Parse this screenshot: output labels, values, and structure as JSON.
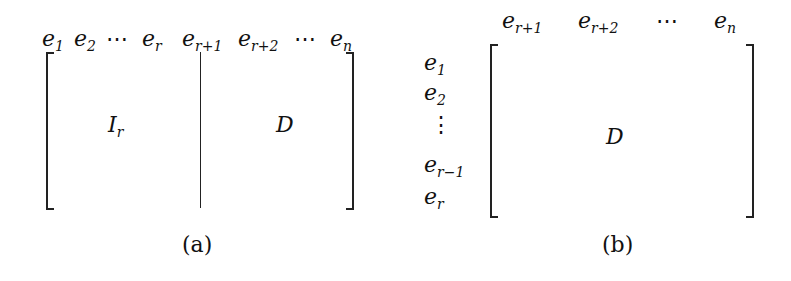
{
  "a": {
    "caption": "(a)",
    "center_left": "I",
    "center_left_sub": "r",
    "center_right": "D",
    "cols": [
      {
        "b": "e",
        "s": "1"
      },
      {
        "b": "e",
        "s": "2"
      },
      {
        "b": "⋯",
        "s": ""
      },
      {
        "b": "e",
        "s": "r"
      },
      {
        "b": "e",
        "s": "r+1"
      },
      {
        "b": "e",
        "s": "r+2"
      },
      {
        "b": "⋯",
        "s": ""
      },
      {
        "b": "e",
        "s": "n"
      }
    ]
  },
  "b": {
    "caption": "(b)",
    "center": "D",
    "cols": [
      {
        "b": "e",
        "s": "r+1"
      },
      {
        "b": "e",
        "s": "r+2"
      },
      {
        "b": "⋯",
        "s": ""
      },
      {
        "b": "e",
        "s": "n"
      }
    ],
    "rows": [
      {
        "b": "e",
        "s": "1"
      },
      {
        "b": "e",
        "s": "2"
      },
      {
        "b": "⋮",
        "s": ""
      },
      {
        "b": "e",
        "s": "r−1"
      },
      {
        "b": "e",
        "s": "r"
      }
    ]
  }
}
